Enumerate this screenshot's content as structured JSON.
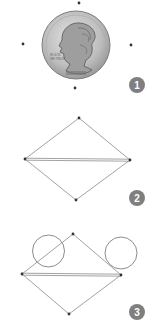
{
  "colors": {
    "background": "#ffffff",
    "point": "#333333",
    "line": "#8a8a8a",
    "badge": "#7f7f7f",
    "badge_text": "#ffffff",
    "coin_fill": "#c8c8c8",
    "coin_edge": "#8c8c8c"
  },
  "panels": [
    {
      "step": "1",
      "description": "Coin surrounded by four marked points",
      "points": [
        {
          "x": 79,
          "y": 3
        },
        {
          "x": 23,
          "y": 44
        },
        {
          "x": 131,
          "y": 45
        },
        {
          "x": 75,
          "y": 88
        }
      ],
      "coin": {
        "cx": 76,
        "cy": 45,
        "r": 34
      },
      "badge": {
        "cx": 137,
        "cy": 85,
        "r": 8
      }
    },
    {
      "step": "2",
      "description": "Four points connected into a rhombus with a double horizontal diagonal",
      "points": [
        {
          "x": 79,
          "y": 118
        },
        {
          "x": 25,
          "y": 159
        },
        {
          "x": 130,
          "y": 160
        },
        {
          "x": 76,
          "y": 200
        }
      ],
      "badge": {
        "cx": 137,
        "cy": 198,
        "r": 8
      }
    },
    {
      "step": "3",
      "description": "Rhombus with two circles drawn near the upper edges",
      "points": [
        {
          "x": 73,
          "y": 234
        },
        {
          "x": 22,
          "y": 274
        },
        {
          "x": 121,
          "y": 275
        },
        {
          "x": 69,
          "y": 314
        }
      ],
      "circles": [
        {
          "cx": 48.5,
          "cy": 251,
          "r": 16
        },
        {
          "cx": 121,
          "cy": 253,
          "r": 16
        }
      ],
      "badge": {
        "cx": 137,
        "cy": 312,
        "r": 8
      }
    }
  ]
}
